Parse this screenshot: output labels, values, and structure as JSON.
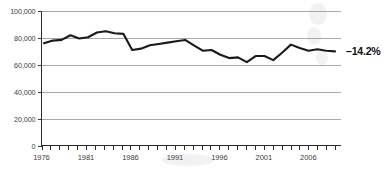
{
  "chart_data": {
    "type": "line",
    "title": "",
    "subtitle": "",
    "xlabel": "",
    "ylabel": "",
    "xlim": [
      1976,
      2009
    ],
    "ylim": [
      0,
      100000
    ],
    "grid": true,
    "legend": null,
    "y_ticks": [
      0,
      20000,
      40000,
      60000,
      80000,
      100000
    ],
    "y_tick_labels": [
      "0",
      "20,000",
      "40,000",
      "60,000",
      "80,000",
      "100,000"
    ],
    "x_ticks": [
      1976,
      1977,
      1978,
      1979,
      1980,
      1981,
      1982,
      1983,
      1984,
      1985,
      1986,
      1987,
      1988,
      1989,
      1990,
      1991,
      1992,
      1993,
      1994,
      1995,
      1996,
      1997,
      1998,
      1999,
      2000,
      2001,
      2002,
      2003,
      2004,
      2005,
      2006,
      2007,
      2008,
      2009
    ],
    "x_tick_labels": [
      "1976",
      "1981",
      "1986",
      "1991",
      "1996",
      "2001",
      "2006"
    ],
    "x_labeled_ticks": [
      1976,
      1981,
      1986,
      1991,
      1996,
      2001,
      2006
    ],
    "x": [
      1976,
      1977,
      1978,
      1979,
      1980,
      1981,
      1982,
      1983,
      1984,
      1985,
      1986,
      1987,
      1988,
      1989,
      1990,
      1991,
      1992,
      1993,
      1994,
      1995,
      1996,
      1997,
      1998,
      1999,
      2000,
      2001,
      2002,
      2003,
      2004,
      2005,
      2006,
      2007,
      2008,
      2009
    ],
    "values": [
      76000,
      78000,
      78500,
      82000,
      79500,
      80500,
      84000,
      85000,
      83500,
      83000,
      71000,
      72000,
      74500,
      75500,
      76500,
      77500,
      78500,
      74500,
      70500,
      71000,
      67500,
      65000,
      65500,
      62000,
      66500,
      66500,
      63500,
      69000,
      75000,
      72500,
      70500,
      71500,
      70500,
      70000
    ],
    "annotations": [
      {
        "text": "–14.2%",
        "x": 2009,
        "y": 70000,
        "position": "end-of-line"
      }
    ],
    "series": [
      {
        "name": "",
        "color": "#1a1a1a",
        "values": [
          76000,
          78000,
          78500,
          82000,
          79500,
          80500,
          84000,
          85000,
          83500,
          83000,
          71000,
          72000,
          74500,
          75500,
          76500,
          77500,
          78500,
          74500,
          70500,
          71000,
          67500,
          65000,
          65500,
          62000,
          66500,
          66500,
          63500,
          69000,
          75000,
          72500,
          70500,
          71500,
          70500,
          70000
        ]
      }
    ]
  },
  "colors": {
    "line": "#1a1a1a",
    "grid": "#a8a8a8",
    "axis": "#2b2b2b",
    "text": "#3d3d3d",
    "annotation": "#111111",
    "background": "#ffffff"
  }
}
